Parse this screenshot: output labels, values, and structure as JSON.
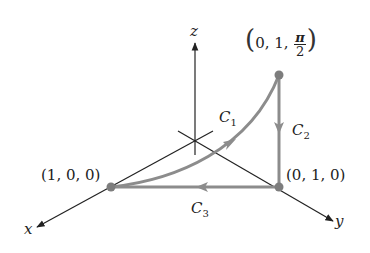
{
  "diagram": {
    "axes": {
      "x": "x",
      "y": "y",
      "z": "z"
    },
    "points": {
      "p100": "(1, 0, 0)",
      "p010": "(0, 1, 0)",
      "ptop_prefix": "0, 1,",
      "ptop_num": "π",
      "ptop_den": "2"
    },
    "curves": {
      "c1": "C",
      "c1_sub": "1",
      "c2": "C",
      "c2_sub": "2",
      "c3": "C",
      "c3_sub": "3"
    },
    "colors": {
      "axis": "#222222",
      "curve": "#8c8c8c",
      "point": "#7d7d7d"
    }
  }
}
